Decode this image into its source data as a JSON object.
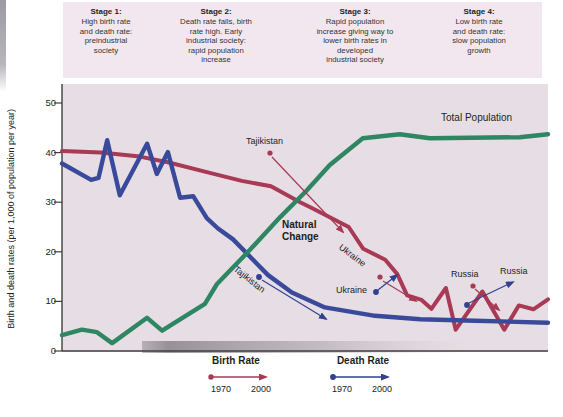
{
  "stages_header": {
    "items": [
      {
        "title": "Stage 1:",
        "body": "High birth rate\nand death rate:\npreindustrial\nsociety"
      },
      {
        "title": "Stage 2:",
        "body": "Death rate falls, birth\nrate high. Early\nindustrial society:\nrapid population\nincrease"
      },
      {
        "title": "Stage 3:",
        "body": "Rapid population\nincrease giving way to\nlower birth rates in\ndeveloped\nindustrial society"
      },
      {
        "title": "Stage 4:",
        "body": "Low birth rate\nand death rate:\nslow population\ngrowth"
      }
    ]
  },
  "y_axis": {
    "label": "Birth and death rates (per 1,000 of population per year)",
    "ticks": [
      0,
      10,
      20,
      30,
      40,
      50
    ]
  },
  "annotations": {
    "total_population_label": "Total Population",
    "natural_change": "Natural\nChange",
    "tajikistan_birth": "Tajikistan",
    "tajikistan_death": "Tajikistan",
    "ukraine_birth": "Ukraine",
    "ukraine_death": "Ukraine",
    "russia_birth": "Russia",
    "russia_death": "Russia"
  },
  "legend": {
    "birth": {
      "title": "Birth Rate",
      "start_year": "1970",
      "end_year": "2000",
      "color": "#a83a55"
    },
    "death": {
      "title": "Death Rate",
      "start_year": "1970",
      "end_year": "2000",
      "color": "#32418f"
    }
  },
  "colors": {
    "plot_background": "#e7dde4",
    "header_background": "#f2e7ee",
    "birth_rate_line": "#a83a55",
    "death_rate_line": "#3a4a9a",
    "population_line": "#2e8663"
  },
  "chart_data": {
    "type": "line",
    "xlabel": "",
    "ylabel": "Birth and death rates (per 1,000 of population per year)",
    "ylim": [
      0,
      50
    ],
    "x_unit": "relative time across demographic transition stages, 0-100 (axis unlabeled)",
    "grid": false,
    "legend_position": "bottom",
    "series": [
      {
        "name": "Birth Rate",
        "color": "#a83a55",
        "points": [
          [
            0,
            40.3
          ],
          [
            8,
            40
          ],
          [
            16,
            39.2
          ],
          [
            22,
            38
          ],
          [
            30,
            36
          ],
          [
            37,
            34.3
          ],
          [
            43,
            33.2
          ],
          [
            49,
            30
          ],
          [
            51.5,
            28.8
          ],
          [
            59,
            25
          ],
          [
            62,
            20.6
          ],
          [
            66.5,
            18.4
          ],
          [
            69,
            15.5
          ],
          [
            71,
            11.2
          ],
          [
            74,
            10.3
          ],
          [
            76,
            8.5
          ],
          [
            79,
            12.7
          ],
          [
            81,
            4.3
          ],
          [
            86.5,
            12
          ],
          [
            91,
            4.3
          ],
          [
            94,
            9.2
          ],
          [
            97,
            8.4
          ],
          [
            100,
            10.4
          ]
        ]
      },
      {
        "name": "Death Rate",
        "color": "#3a4a9a",
        "points": [
          [
            0,
            37.8
          ],
          [
            6,
            34.5
          ],
          [
            7.5,
            34.9
          ],
          [
            9.3,
            42.5
          ],
          [
            11.9,
            31.4
          ],
          [
            17.5,
            41.8
          ],
          [
            19.5,
            35.7
          ],
          [
            21.8,
            40.1
          ],
          [
            24.3,
            30.9
          ],
          [
            27,
            31.2
          ],
          [
            29.8,
            26.8
          ],
          [
            32.1,
            24.7
          ],
          [
            35.2,
            22.5
          ],
          [
            40.1,
            17.6
          ],
          [
            42.4,
            15.3
          ],
          [
            47.3,
            11.8
          ],
          [
            54.1,
            8.8
          ],
          [
            64.4,
            7.1
          ],
          [
            73.7,
            6.4
          ],
          [
            85,
            6.1
          ],
          [
            100,
            5.7
          ]
        ]
      },
      {
        "name": "Total Population",
        "color": "#2e8663",
        "points": [
          [
            0,
            3.2
          ],
          [
            4.1,
            4.3
          ],
          [
            7.2,
            3.8
          ],
          [
            10.3,
            1.6
          ],
          [
            17.5,
            6.7
          ],
          [
            20.6,
            4.1
          ],
          [
            29.4,
            9.5
          ],
          [
            31.9,
            13.5
          ],
          [
            38.3,
            20
          ],
          [
            44.9,
            27
          ],
          [
            50.2,
            32.2
          ],
          [
            55.1,
            37.5
          ],
          [
            61.9,
            42.9
          ],
          [
            69.5,
            43.7
          ],
          [
            75.7,
            42.9
          ],
          [
            94.2,
            43.1
          ],
          [
            100,
            43.7
          ]
        ]
      }
    ],
    "annotations": [
      {
        "label": "Tajikistan",
        "series": "Birth Rate",
        "arrow": "1970 to 2000, pointing down-right"
      },
      {
        "label": "Tajikistan",
        "series": "Death Rate",
        "arrow": "1970 to 2000, pointing down-right"
      },
      {
        "label": "Ukraine",
        "series": "Birth Rate",
        "arrow": "1970 to 2000, pointing down-right"
      },
      {
        "label": "Ukraine",
        "series": "Death Rate",
        "arrow": "1970 to 2000, pointing up-right"
      },
      {
        "label": "Russia",
        "series": "Birth Rate",
        "arrow": "1970 to 2000, pointing down-right"
      },
      {
        "label": "Russia",
        "series": "Death Rate",
        "arrow": "1970 to 2000, pointing up-right"
      },
      {
        "label": "Natural Change",
        "type": "text"
      },
      {
        "label": "Total Population",
        "type": "series-label"
      }
    ]
  }
}
